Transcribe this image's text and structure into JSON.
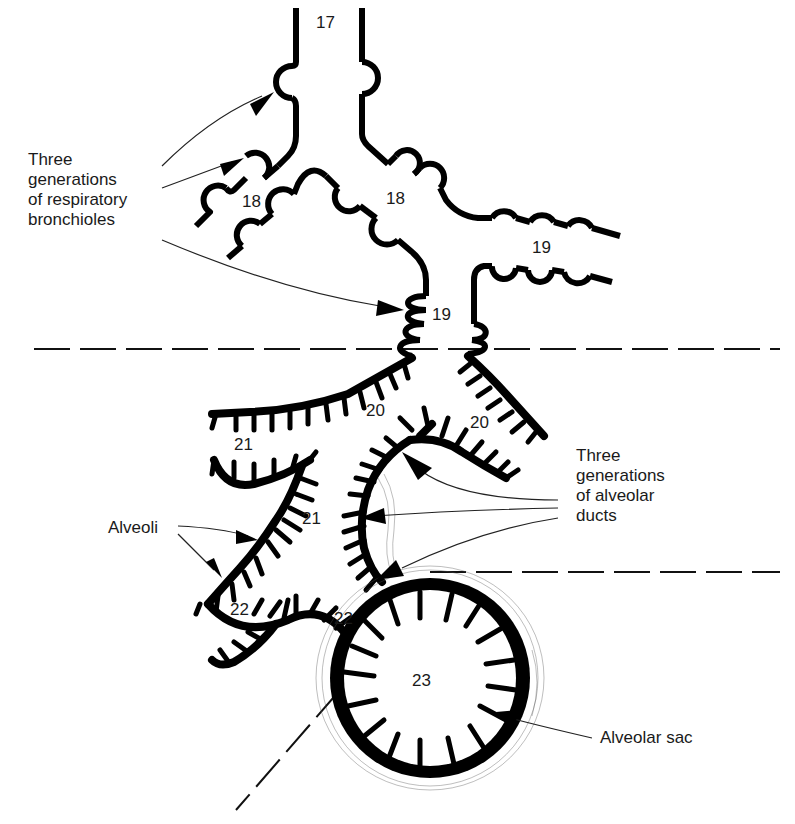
{
  "diagram": {
    "generation_numbers": {
      "g17": "17",
      "g18_left": "18",
      "g18_right": "18",
      "g19_right": "19",
      "g19_center": "19",
      "g20_left": "20",
      "g20_right": "20",
      "g21_left": "21",
      "g21_center": "21",
      "g22_left": "22",
      "g22_right": "22",
      "g23": "23"
    },
    "labels": {
      "respiratory_bronchioles": [
        "Three",
        "generations",
        "of respiratory",
        "bronchioles"
      ],
      "alveolar_ducts": [
        "Three",
        "generations",
        "of alveolar",
        "ducts"
      ],
      "alveoli": "Alveoli",
      "alveolar_sac": "Alveolar sac"
    },
    "zones": [
      {
        "name": "respiratory-bronchioles-zone",
        "generations": [
          "17",
          "18",
          "19"
        ]
      },
      {
        "name": "alveolar-ducts-zone",
        "generations": [
          "20",
          "21",
          "22"
        ]
      },
      {
        "name": "alveolar-sac-zone",
        "generations": [
          "23"
        ]
      }
    ]
  }
}
